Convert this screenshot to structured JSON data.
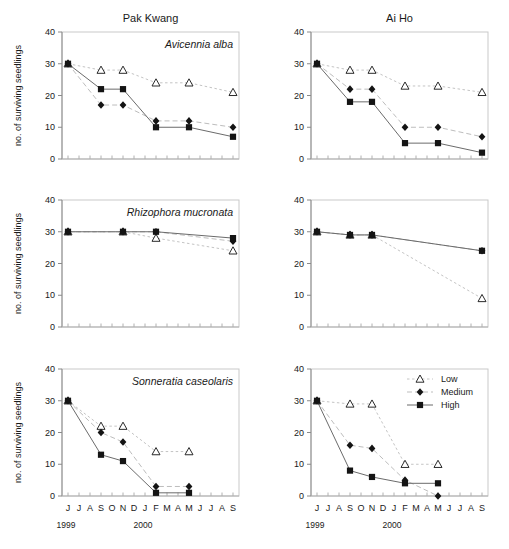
{
  "figure": {
    "columns": [
      {
        "key": "pak_kwang",
        "title": "Pak Kwang"
      },
      {
        "key": "ai_ho",
        "title": "Ai Ho"
      }
    ],
    "y_axis_title": "no. of surviving seedlings",
    "months": [
      "J",
      "J",
      "A",
      "S",
      "O",
      "N",
      "D",
      "J",
      "F",
      "M",
      "A",
      "M",
      "J",
      "J",
      "A",
      "S"
    ],
    "years": [
      {
        "label": "1999",
        "month_index": 0
      },
      {
        "label": "2000",
        "month_index": 7
      }
    ],
    "y_ticks": [
      "0",
      "10",
      "20",
      "30",
      "40"
    ],
    "legend": {
      "position": "top-right of bottom-right panel",
      "entries": [
        {
          "name": "Low",
          "marker": "open-triangle",
          "line": "dotted"
        },
        {
          "name": "Medium",
          "marker": "filled-diamond",
          "line": "dashed"
        },
        {
          "name": "High",
          "marker": "filled-square",
          "line": "solid"
        }
      ]
    },
    "colors": {
      "high_line": "#6b6b6b",
      "medium_line": "#bdbdbd",
      "low_line": "#c4c4c4",
      "marker_fill": "#141414",
      "frame": "#c9c9c9",
      "axis": "#8a8a8a"
    }
  },
  "chart_data": [
    {
      "type": "line",
      "panel": "top-left",
      "site": "Pak Kwang",
      "title": "Avicennia alba",
      "xlabel": "",
      "ylabel": "no. of surviving seedlings",
      "ylim": [
        0,
        40
      ],
      "yticks": [
        0,
        10,
        20,
        30,
        40
      ],
      "x": [
        "J",
        "S",
        "N",
        "F",
        "M",
        "S"
      ],
      "x_index": [
        0,
        3,
        5,
        8,
        11,
        15
      ],
      "series": [
        {
          "name": "Low",
          "values": [
            30,
            28,
            28,
            24,
            24,
            21
          ]
        },
        {
          "name": "Medium",
          "values": [
            30,
            17,
            17,
            12,
            12,
            10
          ]
        },
        {
          "name": "High",
          "values": [
            30,
            22,
            22,
            10,
            10,
            7
          ]
        }
      ]
    },
    {
      "type": "line",
      "panel": "top-right",
      "site": "Ai Ho",
      "title": "",
      "xlabel": "",
      "ylabel": "",
      "ylim": [
        0,
        40
      ],
      "yticks": [
        0,
        10,
        20,
        30,
        40
      ],
      "x": [
        "J",
        "S",
        "N",
        "F",
        "M",
        "S"
      ],
      "x_index": [
        0,
        3,
        5,
        8,
        11,
        15
      ],
      "series": [
        {
          "name": "Low",
          "values": [
            30,
            28,
            28,
            23,
            23,
            21
          ]
        },
        {
          "name": "Medium",
          "values": [
            30,
            22,
            22,
            10,
            10,
            7
          ]
        },
        {
          "name": "High",
          "values": [
            30,
            18,
            18,
            5,
            5,
            2
          ]
        }
      ]
    },
    {
      "type": "line",
      "panel": "middle-left",
      "site": "Pak Kwang",
      "title": "Rhizophora mucronata",
      "xlabel": "",
      "ylabel": "no. of surviving seedlings",
      "ylim": [
        0,
        40
      ],
      "yticks": [
        0,
        10,
        20,
        30,
        40
      ],
      "x": [
        "J",
        "N",
        "F",
        "S"
      ],
      "x_index": [
        0,
        5,
        8,
        15
      ],
      "series": [
        {
          "name": "Low",
          "values": [
            30,
            30,
            28,
            24
          ]
        },
        {
          "name": "Medium",
          "values": [
            30,
            30,
            30,
            27
          ]
        },
        {
          "name": "High",
          "values": [
            30,
            30,
            30,
            28
          ]
        }
      ]
    },
    {
      "type": "line",
      "panel": "middle-right",
      "site": "Ai Ho",
      "title": "",
      "xlabel": "",
      "ylabel": "",
      "ylim": [
        0,
        40
      ],
      "yticks": [
        0,
        10,
        20,
        30,
        40
      ],
      "x": [
        "J",
        "S",
        "N",
        "S"
      ],
      "x_index": [
        0,
        3,
        5,
        15
      ],
      "series": [
        {
          "name": "Low",
          "values": [
            30,
            29,
            29,
            9
          ]
        },
        {
          "name": "Medium",
          "values": [
            30,
            29,
            29,
            24
          ]
        },
        {
          "name": "High",
          "values": [
            30,
            29,
            29,
            24
          ]
        }
      ]
    },
    {
      "type": "line",
      "panel": "bottom-left",
      "site": "Pak Kwang",
      "title": "Sonneratia caseolaris",
      "xlabel": "",
      "ylabel": "no. of surviving seedlings",
      "ylim": [
        0,
        40
      ],
      "yticks": [
        0,
        10,
        20,
        30,
        40
      ],
      "x": [
        "J",
        "S",
        "N",
        "F",
        "M"
      ],
      "x_index": [
        0,
        3,
        5,
        8,
        11
      ],
      "series": [
        {
          "name": "Low",
          "values": [
            30,
            22,
            22,
            14,
            14
          ]
        },
        {
          "name": "Medium",
          "values": [
            30,
            20,
            17,
            3,
            3
          ]
        },
        {
          "name": "High",
          "values": [
            30,
            13,
            11,
            1,
            1
          ]
        }
      ]
    },
    {
      "type": "line",
      "panel": "bottom-right",
      "site": "Ai Ho",
      "title": "",
      "xlabel": "",
      "ylabel": "",
      "ylim": [
        0,
        40
      ],
      "yticks": [
        0,
        10,
        20,
        30,
        40
      ],
      "x": [
        "J",
        "S",
        "N",
        "F",
        "M"
      ],
      "x_index": [
        0,
        3,
        5,
        8,
        11
      ],
      "series": [
        {
          "name": "Low",
          "values": [
            30,
            29,
            29,
            10,
            10
          ]
        },
        {
          "name": "Medium",
          "values": [
            30,
            16,
            15,
            5,
            0
          ]
        },
        {
          "name": "High",
          "values": [
            30,
            8,
            6,
            4,
            4
          ]
        }
      ]
    }
  ]
}
